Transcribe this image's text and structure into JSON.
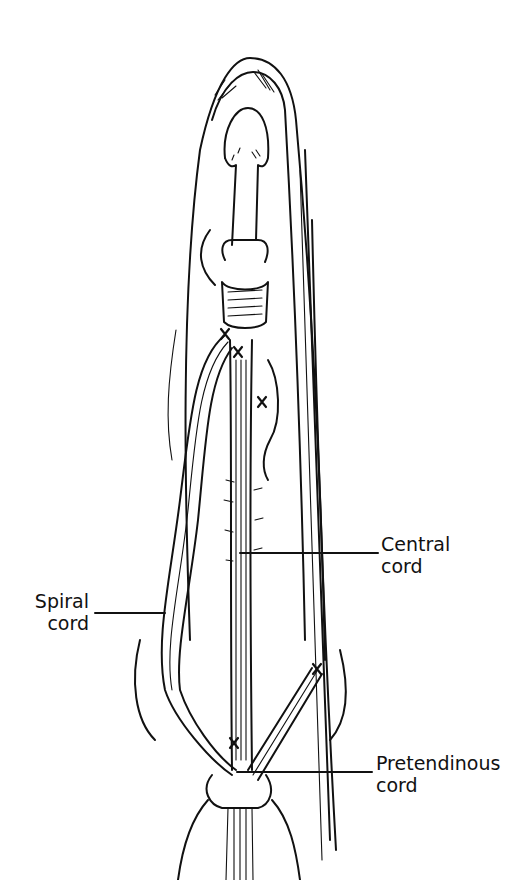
{
  "figure": {
    "labels": {
      "central": {
        "line1": "Central",
        "line2": "cord"
      },
      "spiral": {
        "line1": "Spiral",
        "line2": "cord"
      },
      "pretendinous": {
        "line1": "Pretendinous",
        "line2": "cord"
      }
    },
    "markers": [
      "x",
      "x",
      "x",
      "x",
      "x"
    ],
    "colors": {
      "ink": "#111111",
      "background": "#ffffff"
    }
  }
}
